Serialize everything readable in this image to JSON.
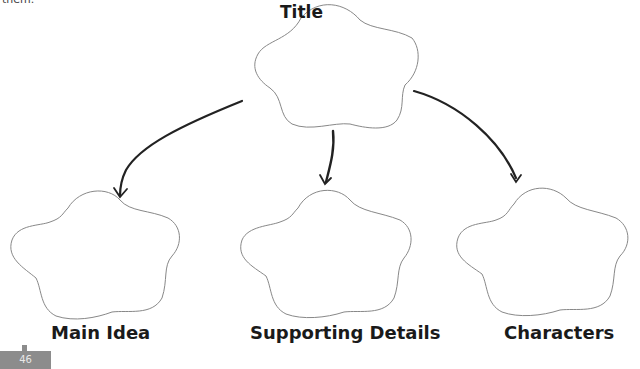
{
  "page": {
    "top_text_fragment": "them.",
    "page_number": "46"
  },
  "organizer": {
    "title_node": {
      "label": "Title"
    },
    "child_nodes": [
      {
        "label": "Main Idea"
      },
      {
        "label": "Supporting Details"
      },
      {
        "label": "Characters"
      }
    ]
  },
  "colors": {
    "outline": "#888888",
    "arrow": "#222222",
    "page_tab": "#8c8c8c"
  }
}
